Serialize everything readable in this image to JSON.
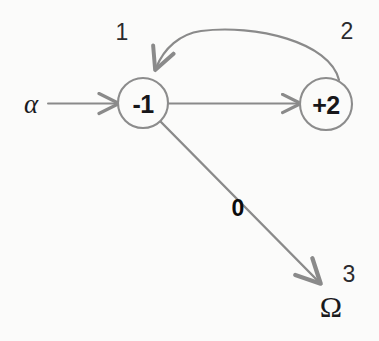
{
  "canvas": {
    "width": 379,
    "height": 341,
    "background_color": "#fbfbfa"
  },
  "style": {
    "edge_color": "#8a8a8a",
    "node_stroke_color": "#8c8c8c",
    "node_fill_color": "#fbfbfa",
    "text_color": "#17171a",
    "weight_text_color": "#0b0b0d"
  },
  "diagram": {
    "type": "directed-graph",
    "title": "",
    "nodes": [
      {
        "id": "n1",
        "label": "-1",
        "index_label": "1",
        "cx": 143,
        "cy": 103,
        "r": 25
      },
      {
        "id": "n2",
        "label": "+2",
        "index_label": "2",
        "cx": 326,
        "cy": 104,
        "r": 26
      },
      {
        "id": "n3",
        "label": "Ω",
        "index_label": "3",
        "cx": 331,
        "cy": 306,
        "r": 0,
        "shape": "text-only"
      }
    ],
    "entry": {
      "label": "α",
      "x": 31,
      "y": 104
    },
    "edges": [
      {
        "id": "e-entry",
        "from": "alpha",
        "to": "n1",
        "weight": "",
        "shape": "straight"
      },
      {
        "id": "e-1-2",
        "from": "n1",
        "to": "n2",
        "weight": "",
        "shape": "straight"
      },
      {
        "id": "e-2-1",
        "from": "n2",
        "to": "n1",
        "weight": "",
        "shape": "curved-arc"
      },
      {
        "id": "e-1-3",
        "from": "n1",
        "to": "n3",
        "weight": "0",
        "shape": "straight-diagonal",
        "weight_x": 238,
        "weight_y": 208
      }
    ]
  }
}
